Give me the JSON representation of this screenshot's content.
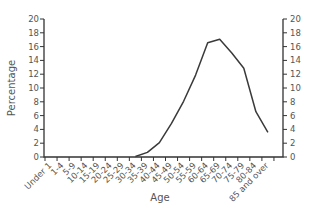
{
  "chart_data": {
    "type": "line",
    "title": "",
    "xlabel": "Age",
    "ylabel": "Percentage",
    "ylim": [
      0,
      20
    ],
    "y_ticks": [
      0,
      2,
      4,
      6,
      8,
      10,
      12,
      14,
      16,
      18,
      20
    ],
    "y_tick_labels": [
      "0",
      "2",
      "4",
      "6",
      "8",
      "10",
      "12",
      "14",
      "16",
      "18",
      "20"
    ],
    "secondary_y_axis": true,
    "grid": false,
    "legend": "none",
    "categories": [
      "Under 1",
      "1-4",
      "5-9",
      "10-14",
      "15-19",
      "20-24",
      "25-29",
      "30-34",
      "35-39",
      "40-44",
      "45-49",
      "50-54",
      "55-59",
      "60-64",
      "65-69",
      "70-74",
      "75-79",
      "80-84",
      "85 and over"
    ],
    "series": [
      {
        "name": "Percentage",
        "values": [
          0,
          0,
          0,
          0,
          0,
          0,
          0,
          0,
          0.6,
          2.0,
          4.8,
          8.0,
          11.8,
          16.5,
          17.0,
          15.0,
          12.8,
          6.5,
          3.5
        ]
      }
    ]
  }
}
